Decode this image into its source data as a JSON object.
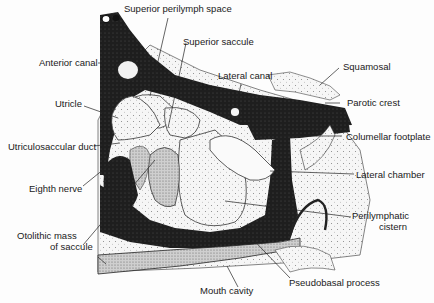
{
  "figure": {
    "type": "anatomical-cross-section",
    "colors": {
      "background": "#fdfdfd",
      "bone_dark": "#1e1e1e",
      "stipple_light": "#f4f4f4",
      "stipple_mid": "#d8d8d8",
      "line": "#222222"
    }
  },
  "labels": {
    "superior_perilymph_space": "Superior perilymph space",
    "superior_saccule": "Superior saccule",
    "anterior_canal": "Anterior canal",
    "lateral_canal": "Lateral canal",
    "squamosal": "Squamosal",
    "utricle": "Utricle",
    "parotic_crest": "Parotic crest",
    "columellar_footplate": "Columellar footplate",
    "utriculosaccular_duct": "Utriculosaccular duct",
    "eighth_nerve": "Eighth nerve",
    "lateral_chamber": "Lateral chamber",
    "otolithic_mass_line1": "Otolithic mass",
    "otolithic_mass_line2": "of saccule",
    "perilymphatic_line1": "Perilymphatic",
    "perilymphatic_line2": "cistern",
    "pseudobasal_process": "Pseudobasal process",
    "mouth_cavity": "Mouth cavity"
  }
}
